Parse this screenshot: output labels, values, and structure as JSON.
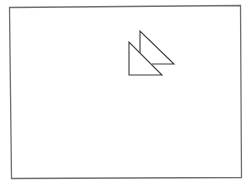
{
  "diagram": {
    "background": "#ffffff",
    "frame": {
      "stroke": "#6e6e6e",
      "stroke_width": 1.3,
      "points": [
        [
          9.5,
          7.5
        ],
        [
          240.5,
          5.5
        ],
        [
          241.5,
          177.5
        ],
        [
          11.5,
          178.5
        ]
      ]
    },
    "shapes": [
      {
        "name": "back-triangle",
        "type": "right-triangle",
        "stroke": "#3a3a3a",
        "stroke_width": 1.1,
        "visible_path": "M140,53 L140,31 L174,64 L152,64"
      },
      {
        "name": "front-triangle",
        "type": "right-triangle",
        "stroke": "#3a3a3a",
        "stroke_width": 1.1,
        "points": [
          [
            129,
            42
          ],
          [
            129,
            75
          ],
          [
            162,
            75
          ]
        ]
      }
    ]
  }
}
